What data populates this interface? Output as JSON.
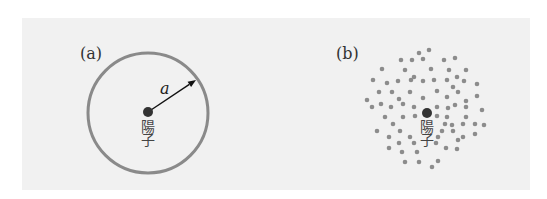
{
  "figure": {
    "background": "#f1f1f1",
    "panel_a": {
      "label": "(a)",
      "circle": {
        "cx": 148,
        "cy": 113,
        "r": 60,
        "stroke": "#8a8a8a"
      },
      "ion_dot": {
        "cx": 148,
        "cy": 112,
        "r": 5,
        "color": "#333333"
      },
      "arrow": {
        "x1": 148,
        "y1": 112,
        "x2": 196,
        "y2": 80
      },
      "radius_label": "a",
      "ion_label_line1": "陽",
      "ion_label_line2": "子"
    },
    "panel_b": {
      "label": "(b)",
      "ion_dot": {
        "cx": 427,
        "cy": 113,
        "r": 5,
        "color": "#333333"
      },
      "electron_color": "#8c8c8c",
      "ion_label_line1": "陽",
      "ion_label_line2": "子",
      "electrons": [
        [
          429,
          50
        ],
        [
          419,
          53
        ],
        [
          401,
          60
        ],
        [
          412,
          60
        ],
        [
          423,
          59
        ],
        [
          444,
          60
        ],
        [
          455,
          58
        ],
        [
          382,
          69
        ],
        [
          405,
          70
        ],
        [
          431,
          69
        ],
        [
          449,
          70
        ],
        [
          466,
          70
        ],
        [
          414,
          77
        ],
        [
          457,
          77
        ],
        [
          373,
          80
        ],
        [
          387,
          83
        ],
        [
          398,
          81
        ],
        [
          411,
          80
        ],
        [
          423,
          81
        ],
        [
          434,
          80
        ],
        [
          447,
          80
        ],
        [
          464,
          81
        ],
        [
          477,
          84
        ],
        [
          453,
          87
        ],
        [
          379,
          92
        ],
        [
          392,
          92
        ],
        [
          410,
          92
        ],
        [
          437,
          91
        ],
        [
          458,
          92
        ],
        [
          367,
          100
        ],
        [
          399,
          99
        ],
        [
          423,
          98
        ],
        [
          447,
          97
        ],
        [
          477,
          96
        ],
        [
          466,
          101
        ],
        [
          372,
          107
        ],
        [
          381,
          104
        ],
        [
          391,
          107
        ],
        [
          403,
          104
        ],
        [
          414,
          107
        ],
        [
          437,
          107
        ],
        [
          448,
          108
        ],
        [
          455,
          105
        ],
        [
          466,
          107
        ],
        [
          482,
          110
        ],
        [
          385,
          117
        ],
        [
          403,
          117
        ],
        [
          415,
          116
        ],
        [
          437,
          116
        ],
        [
          447,
          117
        ],
        [
          466,
          117
        ],
        [
          393,
          124
        ],
        [
          445,
          124
        ],
        [
          452,
          125
        ],
        [
          463,
          124
        ],
        [
          475,
          124
        ],
        [
          484,
          125
        ],
        [
          377,
          131
        ],
        [
          400,
          131
        ],
        [
          442,
          131
        ],
        [
          453,
          131
        ],
        [
          389,
          137
        ],
        [
          410,
          137
        ],
        [
          438,
          137
        ],
        [
          463,
          137
        ],
        [
          475,
          134
        ],
        [
          399,
          143
        ],
        [
          414,
          143
        ],
        [
          436,
          143
        ],
        [
          458,
          140
        ],
        [
          389,
          148
        ],
        [
          446,
          148
        ],
        [
          457,
          149
        ],
        [
          402,
          152
        ],
        [
          417,
          152
        ],
        [
          405,
          162
        ],
        [
          419,
          162
        ],
        [
          438,
          161
        ],
        [
          432,
          167
        ]
      ]
    }
  }
}
